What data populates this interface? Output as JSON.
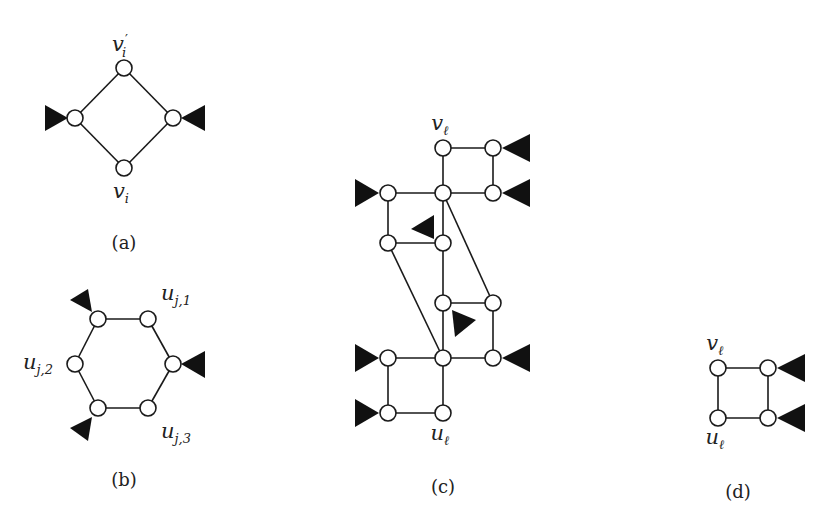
{
  "figure": {
    "panels": [
      {
        "id": "a",
        "caption": "(a)",
        "shape": "diamond",
        "labels": {
          "top": "v",
          "top_prime": "′",
          "top_sub": "i",
          "bottom": "v",
          "bottom_sub": "i"
        },
        "nodes": [
          [
            124,
            68
          ],
          [
            75,
            118
          ],
          [
            173,
            118
          ],
          [
            124,
            168
          ]
        ],
        "edges": [
          [
            0,
            1
          ],
          [
            0,
            2
          ],
          [
            1,
            3
          ],
          [
            2,
            3
          ]
        ],
        "triangles": [
          {
            "at": [
              75,
              118
            ],
            "points": "45,105 45,131 68,118"
          },
          {
            "at": [
              173,
              118
            ],
            "points": "205,105 205,131 181,118"
          }
        ]
      },
      {
        "id": "b",
        "caption": "(b)",
        "shape": "hexagon",
        "labels": {
          "u1": "u",
          "u1_sub": "j,1",
          "u2": "u",
          "u2_sub": "j,2",
          "u3": "u",
          "u3_sub": "j,3"
        },
        "nodes": [
          [
            98,
            319
          ],
          [
            148,
            319
          ],
          [
            75,
            364
          ],
          [
            173,
            364
          ],
          [
            98,
            408
          ],
          [
            148,
            408
          ]
        ],
        "edges": [
          [
            0,
            1
          ],
          [
            0,
            2
          ],
          [
            1,
            3
          ],
          [
            2,
            4
          ],
          [
            3,
            5
          ],
          [
            4,
            5
          ]
        ],
        "triangles": [
          {
            "at": [
              98,
              319
            ],
            "points": "70,300 88,289 92,312"
          },
          {
            "at": [
              173,
              364
            ],
            "points": "205,351 205,378 181,364"
          },
          {
            "at": [
              98,
              408
            ],
            "points": "70,428 92,417 88,441"
          }
        ]
      },
      {
        "id": "c",
        "caption": "(c)",
        "shape": "gadget",
        "labels": {
          "top": "v",
          "top_sub": "ℓ",
          "bottom": "u",
          "bottom_sub": "ℓ"
        },
        "nodes": [
          [
            443,
            148
          ],
          [
            493,
            148
          ],
          [
            388,
            193
          ],
          [
            443,
            193
          ],
          [
            493,
            193
          ],
          [
            388,
            243
          ],
          [
            443,
            243
          ],
          [
            443,
            303
          ],
          [
            493,
            303
          ],
          [
            388,
            358
          ],
          [
            443,
            358
          ],
          [
            493,
            358
          ],
          [
            388,
            413
          ],
          [
            443,
            413
          ]
        ],
        "edges": [
          [
            0,
            1
          ],
          [
            0,
            3
          ],
          [
            1,
            4
          ],
          [
            2,
            3
          ],
          [
            3,
            4
          ],
          [
            2,
            5
          ],
          [
            3,
            6
          ],
          [
            5,
            6
          ],
          [
            6,
            7
          ],
          [
            7,
            8
          ],
          [
            3,
            8
          ],
          [
            8,
            11
          ],
          [
            7,
            10
          ],
          [
            5,
            10
          ],
          [
            9,
            10
          ],
          [
            10,
            11
          ],
          [
            9,
            12
          ],
          [
            10,
            13
          ],
          [
            12,
            13
          ]
        ],
        "triangles": [
          {
            "at": [
              493,
              148
            ],
            "points": "530,134 530,162 502,148"
          },
          {
            "at": [
              493,
              193
            ],
            "points": "530,179 530,207 502,193"
          },
          {
            "at": [
              388,
              193
            ],
            "points": "355,179 355,207 379,193"
          },
          {
            "at": [
              443,
              243
            ],
            "points": "411,229 434,215 434,239"
          },
          {
            "at": [
              443,
              303
            ],
            "points": "452,310 476,320 455,337"
          },
          {
            "at": [
              388,
              358
            ],
            "points": "355,344 355,372 379,358"
          },
          {
            "at": [
              493,
              358
            ],
            "points": "530,344 530,372 502,358"
          },
          {
            "at": [
              388,
              413
            ],
            "points": "355,399 355,427 379,413"
          }
        ]
      },
      {
        "id": "d",
        "caption": "(d)",
        "shape": "square",
        "labels": {
          "top": "v",
          "top_sub": "ℓ",
          "bottom": "u",
          "bottom_sub": "ℓ"
        },
        "nodes": [
          [
            718,
            368
          ],
          [
            768,
            368
          ],
          [
            718,
            418
          ],
          [
            768,
            418
          ]
        ],
        "edges": [
          [
            0,
            1
          ],
          [
            0,
            2
          ],
          [
            1,
            3
          ],
          [
            2,
            3
          ]
        ],
        "triangles": [
          {
            "at": [
              768,
              368
            ],
            "points": "805,354 805,382 777,368"
          },
          {
            "at": [
              768,
              418
            ],
            "points": "805,404 805,432 777,418"
          }
        ]
      }
    ]
  }
}
